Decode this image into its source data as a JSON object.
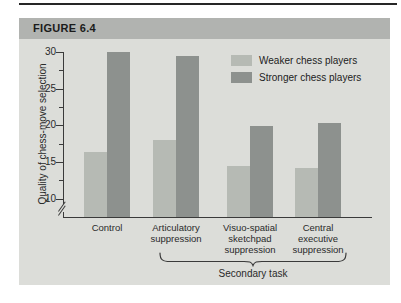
{
  "page": {
    "figure_label": "FIGURE 6.4"
  },
  "colors": {
    "panel_background": "#dcddd9",
    "header_band": "#b1b3b0",
    "axis": "#3a3a3a",
    "weaker_bar": "#b6bab4",
    "stronger_bar": "#8d918e",
    "top_rule": "#262626"
  },
  "chart_data": {
    "type": "bar",
    "title": "",
    "ylabel": "Quality of chess-move selection",
    "xlabel": "",
    "categories": [
      "Control",
      "Articulatory suppression",
      "Visuo-spatial sketchpad suppression",
      "Central executive suppression"
    ],
    "category_lines": [
      [
        "Control"
      ],
      [
        "Articulatory",
        "suppression"
      ],
      [
        "Visuo-spatial",
        "sketchpad",
        "suppression"
      ],
      [
        "Central",
        "executive",
        "suppression"
      ]
    ],
    "series": [
      {
        "name": "Weaker chess players",
        "color": "#b6bab4",
        "values": [
          16.4,
          18.0,
          14.4,
          14.2
        ]
      },
      {
        "name": "Stronger chess players",
        "color": "#8d918e",
        "values": [
          30.0,
          29.5,
          19.9,
          20.3
        ]
      }
    ],
    "yticks": [
      10,
      15,
      20,
      25,
      30
    ],
    "minor_yticks": [
      12.5,
      17.5,
      22.5,
      27.5
    ],
    "ylim": [
      7.5,
      30
    ],
    "axis_break": true,
    "grid": false,
    "legend_position": "top-right",
    "annotation": {
      "label": "Secondary task",
      "spans": "last three categories"
    }
  }
}
